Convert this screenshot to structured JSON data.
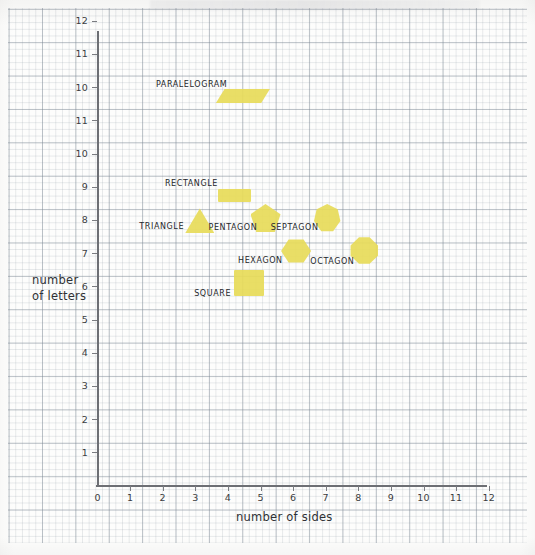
{
  "chart_data": {
    "type": "scatter",
    "title": "",
    "xlabel": "number of sides",
    "ylabel": "number of letters",
    "xlim": [
      0,
      12
    ],
    "ylim": [
      0,
      12
    ],
    "grid": true,
    "legend": false,
    "x_ticks": [
      "0",
      "1",
      "2",
      "3",
      "4",
      "5",
      "6",
      "7",
      "8",
      "9",
      "10",
      "11",
      "12"
    ],
    "y_ticks": [
      "12",
      "11",
      "10",
      "11",
      "10",
      "9",
      "8",
      "7",
      "6",
      "5",
      "4",
      "3",
      "2",
      "1"
    ],
    "points": [
      {
        "label": "PARALELOGRAM",
        "x": 4,
        "y": 12,
        "marker": "parallelogram"
      },
      {
        "label": "RECTANGLE",
        "x": 4,
        "y": 9,
        "marker": "rect"
      },
      {
        "label": "TRIANGLE",
        "x": 3,
        "y": 8,
        "marker": "triangle"
      },
      {
        "label": "PENTAGON",
        "x": 5,
        "y": 8,
        "marker": "pentagon"
      },
      {
        "label": "SEPTAGON",
        "x": 7,
        "y": 8,
        "marker": "heptagon"
      },
      {
        "label": "HEXAGON",
        "x": 6,
        "y": 7,
        "marker": "hexagon"
      },
      {
        "label": "OCTAGON",
        "x": 8,
        "y": 7,
        "marker": "octagon"
      },
      {
        "label": "SQUARE",
        "x": 4.5,
        "y": 6,
        "marker": "square"
      }
    ],
    "marker_color": "#e8dc59"
  },
  "axes": {
    "y_title_line1": "number",
    "y_title_line2": "of letters",
    "x_title": "number of sides"
  }
}
